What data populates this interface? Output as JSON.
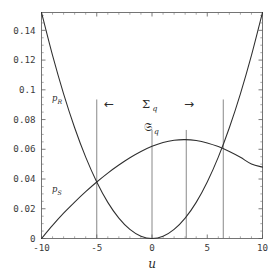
{
  "chart_data": {
    "type": "line",
    "title": "",
    "subtitle": "",
    "xlabel": "u",
    "ylabel": "",
    "xlim": [
      -10,
      10
    ],
    "ylim": [
      0,
      0.152
    ],
    "grid": false,
    "legend": "inline-curve-labels",
    "xticks": [
      -10,
      -5,
      0,
      5,
      10
    ],
    "xtick_labels": [
      "-10",
      "-5",
      "0",
      "5",
      "10"
    ],
    "yticks": [
      0,
      0.02,
      0.04,
      0.06,
      0.08,
      0.1,
      0.12,
      0.14
    ],
    "ytick_labels": [
      "0",
      "0.02",
      "0.04",
      "0.06",
      "0.08",
      "0.1",
      "0.12",
      "0.14"
    ],
    "series": [
      {
        "name": "p_R",
        "label": "p",
        "label_sub": "R",
        "description": "Upward parabola with minimum at u = 0, value 0",
        "x": [
          -10,
          -9,
          -8,
          -7,
          -6,
          -5,
          -4,
          -3,
          -2,
          -1,
          0,
          1,
          2,
          3,
          4,
          5,
          6,
          7,
          8,
          9,
          10
        ],
        "y": [
          0.152,
          0.1231,
          0.0973,
          0.0745,
          0.0547,
          0.038,
          0.0243,
          0.0137,
          0.0061,
          0.0015,
          0.0,
          0.0015,
          0.0061,
          0.0137,
          0.0243,
          0.038,
          0.0547,
          0.0745,
          0.0973,
          0.1231,
          0.152
        ]
      },
      {
        "name": "p_S",
        "label": "p",
        "label_sub": "S",
        "description": "Concave curve rising from 0 at u = -10 to a maximum near u = 3.1 (0.0665) then falling to 0.048 at u = 10",
        "x": [
          -10,
          -9,
          -8,
          -7,
          -6,
          -5,
          -4,
          -3,
          -2,
          -1,
          0,
          1,
          2,
          3,
          4,
          5,
          6,
          7,
          8,
          9,
          10
        ],
        "y": [
          0.0,
          0.0088,
          0.017,
          0.0245,
          0.0315,
          0.038,
          0.044,
          0.0494,
          0.0543,
          0.0585,
          0.062,
          0.0646,
          0.0661,
          0.0665,
          0.0659,
          0.0643,
          0.0618,
          0.0585,
          0.0546,
          0.0501,
          0.048
        ]
      }
    ],
    "vertical_lines": [
      {
        "x": -5,
        "y_top": 0.0935,
        "y_bottom": 0.0
      },
      {
        "x": 0,
        "y_top": 0.073,
        "y_bottom": 0.0
      },
      {
        "x": 3.1,
        "y_top": 0.073,
        "y_bottom": 0.0
      },
      {
        "x": 6.45,
        "y_top": 0.0935,
        "y_bottom": 0.0
      }
    ],
    "annotations": [
      {
        "name": "sigma-q-label",
        "text": "Σ",
        "sub": "q",
        "x": 3.0,
        "y": 0.087
      },
      {
        "name": "frak-s-q-label",
        "text": "𝔖",
        "sub": "q",
        "x": 1.4,
        "y": 0.071
      },
      {
        "name": "left-arrow",
        "text": "←",
        "x": -3.5,
        "y": 0.0865
      },
      {
        "name": "right-arrow",
        "text": "→",
        "x": 3.6,
        "y": 0.0865
      }
    ],
    "intersections": [
      {
        "u": -5,
        "p": 0.038
      },
      {
        "u": 6.45,
        "p": 0.0625
      }
    ]
  },
  "axis": {
    "x_title": "u"
  },
  "colors": {
    "curve": "#2e2e2e",
    "frame": "#5c5c5c",
    "vline": "#6b6b6b",
    "text": "#2b2b2b",
    "tick_text": "#3a3a3a",
    "background": "#ffffff"
  }
}
